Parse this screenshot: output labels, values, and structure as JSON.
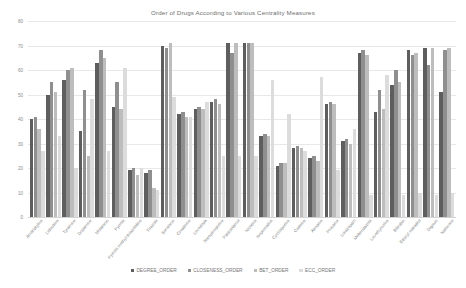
{
  "chart_data": {
    "type": "bar",
    "title": "Order of Drugs According to Various Centrality Measures",
    "xlabel": "",
    "ylabel": "",
    "ylim": [
      0,
      80
    ],
    "yticks": [
      0,
      10,
      20,
      30,
      40,
      50,
      60,
      70,
      80
    ],
    "grid": true,
    "legend_position": "bottom",
    "categories": [
      "Amitriptyline",
      "Lidocaine",
      "Tyramine",
      "Dopamine",
      "Melatonin",
      "Pyrrole",
      "Pyrrole methyl-thiazolidine",
      "Triazole",
      "Serotonin",
      "Creatinine",
      "Levodopa",
      "Norepinephrine",
      "Paracetamol",
      "Nicotine",
      "Isoprenaline",
      "Cyclosporine",
      "Codeine",
      "Atropine",
      "Procaine",
      "Lorazepam",
      "Mebendazole",
      "Levothyroxine",
      "Bilirubin",
      "Ethinyl estradiol",
      "Digoxin",
      "Naloxone"
    ],
    "series": [
      {
        "name": "DEGREE_ORDER",
        "color": "#5e5e5e",
        "values": [
          40,
          50,
          56,
          35,
          63,
          45,
          19,
          18,
          70,
          42,
          44,
          47,
          71,
          71,
          33,
          21,
          28,
          24,
          46,
          31,
          67,
          43,
          54,
          68,
          69,
          51
        ]
      },
      {
        "name": "CLOSENESS_ORDER",
        "color": "#8f8f8f",
        "values": [
          41,
          55,
          60,
          52,
          68,
          55,
          20,
          19,
          69,
          43,
          45,
          48,
          67,
          71,
          34,
          22,
          29,
          25,
          47,
          32,
          68,
          52,
          60,
          66,
          62,
          68
        ]
      },
      {
        "name": "BET_ORDER",
        "color": "#bdbdbd",
        "values": [
          36,
          51,
          61,
          25,
          65,
          44,
          17,
          12,
          71,
          41,
          44,
          46,
          71,
          71,
          33,
          22,
          28,
          23,
          46,
          30,
          66,
          44,
          55,
          67,
          69,
          69
        ]
      },
      {
        "name": "ECC_ORDER",
        "color": "#dcdcdc",
        "values": [
          27,
          33,
          20,
          48,
          27,
          61,
          20,
          11,
          49,
          41,
          47,
          25,
          25,
          25,
          56,
          42,
          27,
          57,
          19,
          36,
          9,
          58,
          9,
          10,
          9,
          10
        ]
      }
    ]
  },
  "legend": {
    "items": [
      {
        "label": "DEGREE_ORDER",
        "color": "#5e5e5e"
      },
      {
        "label": "CLOSENESS_ORDER",
        "color": "#8f8f8f"
      },
      {
        "label": "BET_ORDER",
        "color": "#bdbdbd"
      },
      {
        "label": "ECC_ORDER",
        "color": "#dcdcdc"
      }
    ]
  }
}
